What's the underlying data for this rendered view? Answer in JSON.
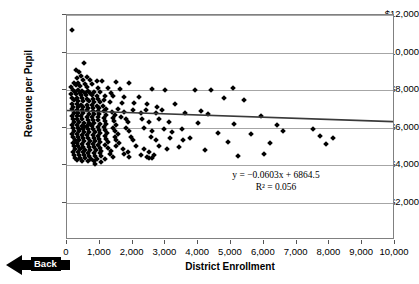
{
  "chart_data": {
    "type": "scatter",
    "title": "",
    "xlabel": "District Enrollment",
    "ylabel": "Revenue per Pupil",
    "xlim": [
      0,
      10000
    ],
    "ylim": [
      0,
      12000
    ],
    "grid": true,
    "legend": "none",
    "xticks": [
      "0",
      "1,000",
      "2,000",
      "3,000",
      "4,000",
      "5,000",
      "6,000",
      "7,000",
      "8,000",
      "9,000",
      "10,000"
    ],
    "xtick_values": [
      0,
      1000,
      2000,
      3000,
      4000,
      5000,
      6000,
      7000,
      8000,
      9000,
      10000
    ],
    "yticks": [
      "$2,000",
      "$4,000",
      "$6,000",
      "$8,000",
      "$10,000",
      "$12,000"
    ],
    "ytick_values": [
      2000,
      4000,
      6000,
      8000,
      10000,
      12000
    ],
    "annotations": [
      {
        "name": "regression-equation",
        "text": "y = −0.0603x + 6864.5"
      },
      {
        "name": "r-squared",
        "text": "R² = 0.056"
      }
    ],
    "trendline": {
      "type": "linear",
      "slope": -0.0603,
      "intercept": 6864.5,
      "r_squared": 0.056,
      "x_start": 0,
      "y_start": 6864.5,
      "x_end": 10000,
      "y_end": 6261.5,
      "color": "#3a3a3a"
    },
    "marker": {
      "shape": "diamond",
      "color": "#000000",
      "size": 4
    },
    "points": [
      [
        150,
        11200
      ],
      [
        520,
        9450
      ],
      [
        260,
        9050
      ],
      [
        370,
        8980
      ],
      [
        440,
        8760
      ],
      [
        600,
        8700
      ],
      [
        310,
        8620
      ],
      [
        480,
        8560
      ],
      [
        700,
        8530
      ],
      [
        900,
        8500
      ],
      [
        1080,
        8480
      ],
      [
        1500,
        8420
      ],
      [
        1900,
        8400
      ],
      [
        5050,
        8130
      ],
      [
        3900,
        8020
      ],
      [
        4400,
        8010
      ],
      [
        210,
        8400
      ],
      [
        340,
        8350
      ],
      [
        560,
        8330
      ],
      [
        760,
        8300
      ],
      [
        280,
        8260
      ],
      [
        410,
        8220
      ],
      [
        130,
        8180
      ],
      [
        620,
        8150
      ],
      [
        950,
        8120
      ],
      [
        1250,
        8100
      ],
      [
        1620,
        8060
      ],
      [
        2600,
        8030
      ],
      [
        3000,
        7990
      ],
      [
        180,
        8000
      ],
      [
        330,
        7980
      ],
      [
        470,
        7960
      ],
      [
        640,
        7940
      ],
      [
        820,
        7920
      ],
      [
        1000,
        7900
      ],
      [
        240,
        7880
      ],
      [
        390,
        7860
      ],
      [
        540,
        7840
      ],
      [
        700,
        7820
      ],
      [
        130,
        7800
      ],
      [
        280,
        7780
      ],
      [
        430,
        7760
      ],
      [
        590,
        7740
      ],
      [
        760,
        7720
      ],
      [
        920,
        7700
      ],
      [
        1150,
        7690
      ],
      [
        1400,
        7660
      ],
      [
        1750,
        7640
      ],
      [
        2200,
        7620
      ],
      [
        4800,
        7550
      ],
      [
        5400,
        7480
      ],
      [
        160,
        7600
      ],
      [
        300,
        7580
      ],
      [
        450,
        7560
      ],
      [
        610,
        7540
      ],
      [
        790,
        7520
      ],
      [
        950,
        7500
      ],
      [
        1120,
        7480
      ],
      [
        200,
        7460
      ],
      [
        350,
        7440
      ],
      [
        500,
        7420
      ],
      [
        670,
        7400
      ],
      [
        830,
        7380
      ],
      [
        1010,
        7360
      ],
      [
        1300,
        7340
      ],
      [
        1680,
        7320
      ],
      [
        2050,
        7300
      ],
      [
        2450,
        7280
      ],
      [
        3300,
        7250
      ],
      [
        140,
        7260
      ],
      [
        290,
        7240
      ],
      [
        440,
        7220
      ],
      [
        600,
        7200
      ],
      [
        760,
        7180
      ],
      [
        920,
        7160
      ],
      [
        1100,
        7140
      ],
      [
        180,
        7120
      ],
      [
        330,
        7100
      ],
      [
        480,
        7080
      ],
      [
        640,
        7060
      ],
      [
        800,
        7040
      ],
      [
        970,
        7020
      ],
      [
        1200,
        7000
      ],
      [
        1550,
        6980
      ],
      [
        2000,
        6960
      ],
      [
        2400,
        6940
      ],
      [
        2900,
        6920
      ],
      [
        160,
        6980
      ],
      [
        310,
        6960
      ],
      [
        460,
        6940
      ],
      [
        620,
        6920
      ],
      [
        780,
        6900
      ],
      [
        940,
        6880
      ],
      [
        1120,
        6860
      ],
      [
        1380,
        6840
      ],
      [
        1750,
        6820
      ],
      [
        2250,
        6800
      ],
      [
        2700,
        6780
      ],
      [
        3600,
        6760
      ],
      [
        4300,
        6700
      ],
      [
        5900,
        6640
      ],
      [
        200,
        6800
      ],
      [
        350,
        6780
      ],
      [
        500,
        6760
      ],
      [
        660,
        6740
      ],
      [
        820,
        6720
      ],
      [
        990,
        6700
      ],
      [
        1180,
        6680
      ],
      [
        1450,
        6660
      ],
      [
        140,
        6640
      ],
      [
        290,
        6620
      ],
      [
        440,
        6600
      ],
      [
        600,
        6580
      ],
      [
        760,
        6560
      ],
      [
        930,
        6540
      ],
      [
        1120,
        6520
      ],
      [
        1400,
        6500
      ],
      [
        1800,
        6480
      ],
      [
        2300,
        6460
      ],
      [
        2800,
        6440
      ],
      [
        170,
        6480
      ],
      [
        320,
        6460
      ],
      [
        470,
        6440
      ],
      [
        630,
        6420
      ],
      [
        790,
        6400
      ],
      [
        960,
        6380
      ],
      [
        1150,
        6360
      ],
      [
        1420,
        6340
      ],
      [
        1850,
        6320
      ],
      [
        2500,
        6300
      ],
      [
        3100,
        6280
      ],
      [
        4000,
        6250
      ],
      [
        5100,
        6200
      ],
      [
        6400,
        6150
      ],
      [
        210,
        6300
      ],
      [
        360,
        6280
      ],
      [
        510,
        6260
      ],
      [
        670,
        6240
      ],
      [
        830,
        6220
      ],
      [
        1000,
        6200
      ],
      [
        1200,
        6180
      ],
      [
        1500,
        6160
      ],
      [
        150,
        6140
      ],
      [
        300,
        6120
      ],
      [
        450,
        6100
      ],
      [
        610,
        6080
      ],
      [
        770,
        6060
      ],
      [
        940,
        6040
      ],
      [
        1130,
        6020
      ],
      [
        1400,
        6000
      ],
      [
        1800,
        5980
      ],
      [
        2350,
        5960
      ],
      [
        2950,
        5940
      ],
      [
        3500,
        5920
      ],
      [
        180,
        5980
      ],
      [
        330,
        5960
      ],
      [
        480,
        5940
      ],
      [
        640,
        5920
      ],
      [
        800,
        5900
      ],
      [
        970,
        5880
      ],
      [
        1160,
        5860
      ],
      [
        1450,
        5840
      ],
      [
        1900,
        5820
      ],
      [
        2600,
        5800
      ],
      [
        3200,
        5780
      ],
      [
        4600,
        5720
      ],
      [
        5600,
        5660
      ],
      [
        7700,
        5560
      ],
      [
        220,
        5820
      ],
      [
        370,
        5800
      ],
      [
        520,
        5780
      ],
      [
        680,
        5760
      ],
      [
        840,
        5740
      ],
      [
        1010,
        5720
      ],
      [
        1220,
        5700
      ],
      [
        1550,
        5680
      ],
      [
        160,
        5660
      ],
      [
        310,
        5640
      ],
      [
        460,
        5620
      ],
      [
        620,
        5600
      ],
      [
        780,
        5580
      ],
      [
        950,
        5560
      ],
      [
        1150,
        5540
      ],
      [
        1450,
        5520
      ],
      [
        1950,
        5500
      ],
      [
        2550,
        5480
      ],
      [
        3150,
        5460
      ],
      [
        3750,
        5440
      ],
      [
        190,
        5500
      ],
      [
        340,
        5480
      ],
      [
        490,
        5460
      ],
      [
        650,
        5440
      ],
      [
        810,
        5420
      ],
      [
        980,
        5400
      ],
      [
        1180,
        5380
      ],
      [
        1500,
        5360
      ],
      [
        2000,
        5340
      ],
      [
        2700,
        5320
      ],
      [
        4900,
        5250
      ],
      [
        6200,
        5180
      ],
      [
        7900,
        5100
      ],
      [
        230,
        5340
      ],
      [
        380,
        5320
      ],
      [
        530,
        5300
      ],
      [
        690,
        5280
      ],
      [
        850,
        5260
      ],
      [
        1020,
        5240
      ],
      [
        1250,
        5220
      ],
      [
        1600,
        5200
      ],
      [
        170,
        5180
      ],
      [
        320,
        5160
      ],
      [
        470,
        5140
      ],
      [
        630,
        5120
      ],
      [
        790,
        5100
      ],
      [
        960,
        5080
      ],
      [
        1170,
        5060
      ],
      [
        1500,
        5040
      ],
      [
        2100,
        5020
      ],
      [
        2800,
        5000
      ],
      [
        3400,
        4980
      ],
      [
        200,
        5020
      ],
      [
        350,
        5000
      ],
      [
        500,
        4980
      ],
      [
        660,
        4960
      ],
      [
        820,
        4940
      ],
      [
        1000,
        4920
      ],
      [
        1250,
        4900
      ],
      [
        1700,
        4880
      ],
      [
        2350,
        4860
      ],
      [
        3050,
        4840
      ],
      [
        4200,
        4800
      ],
      [
        240,
        4860
      ],
      [
        390,
        4840
      ],
      [
        540,
        4820
      ],
      [
        700,
        4800
      ],
      [
        870,
        4780
      ],
      [
        1050,
        4760
      ],
      [
        1350,
        4740
      ],
      [
        1850,
        4720
      ],
      [
        2500,
        4700
      ],
      [
        180,
        4720
      ],
      [
        330,
        4700
      ],
      [
        480,
        4680
      ],
      [
        640,
        4660
      ],
      [
        810,
        4640
      ],
      [
        1000,
        4620
      ],
      [
        1300,
        4600
      ],
      [
        1750,
        4580
      ],
      [
        2250,
        4560
      ],
      [
        2650,
        4540
      ],
      [
        2450,
        4450
      ],
      [
        2500,
        4380
      ],
      [
        210,
        4560
      ],
      [
        360,
        4540
      ],
      [
        510,
        4520
      ],
      [
        680,
        4500
      ],
      [
        850,
        4480
      ],
      [
        1050,
        4460
      ],
      [
        1400,
        4440
      ],
      [
        1900,
        4420
      ],
      [
        2600,
        4400
      ],
      [
        840,
        4080
      ],
      [
        250,
        4400
      ],
      [
        400,
        4380
      ],
      [
        560,
        4360
      ],
      [
        730,
        4340
      ],
      [
        900,
        4320
      ],
      [
        1150,
        4300
      ],
      [
        300,
        4260
      ],
      [
        470,
        4240
      ],
      [
        650,
        4220
      ],
      [
        820,
        4200
      ],
      [
        1050,
        4180
      ],
      [
        380,
        5900
      ],
      [
        520,
        6050
      ],
      [
        690,
        6180
      ],
      [
        1350,
        7850
      ],
      [
        2750,
        7100
      ],
      [
        1650,
        6550
      ],
      [
        3550,
        5350
      ],
      [
        4100,
        6900
      ],
      [
        6600,
        5800
      ],
      [
        7500,
        5900
      ],
      [
        8100,
        5420
      ],
      [
        5200,
        4500
      ],
      [
        6000,
        4600
      ]
    ]
  },
  "controls": {
    "back_button": {
      "label": "Back",
      "icon": "left-arrow-icon",
      "color": "#000000"
    }
  }
}
